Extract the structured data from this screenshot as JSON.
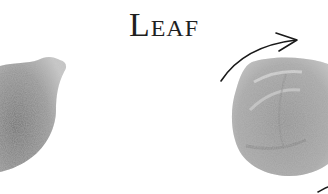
{
  "title": {
    "text": "Leaf"
  },
  "illustrations": [
    {
      "name": "left-leaf-sketch",
      "description": "grey pencil-shaded leaf shape, partially cropped on left edge"
    },
    {
      "name": "right-seed-sketch",
      "description": "grey pencil-shaded rounded seed/leaf with curved ridges"
    },
    {
      "name": "rotation-arrow",
      "description": "curved black arrow arcing over right sketch"
    }
  ],
  "colors": {
    "background": "#ffffff",
    "title": "#1f1f1f",
    "sketch_dark": "#6a6a6a",
    "sketch_light": "#b5b5b5",
    "arrow": "#1a1a1a"
  }
}
